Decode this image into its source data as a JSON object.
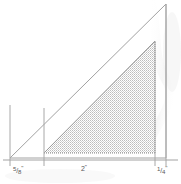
{
  "drawing": {
    "title": "Right triangle dimension drawing",
    "background_color": "#ffffff",
    "line_color": "#9a9a9a",
    "fill_color": "#c9c9c9",
    "text_color": "#585858",
    "outer_triangle": {
      "name": "outer-triangle",
      "vertices": [
        [
          10,
          158
        ],
        [
          166,
          158
        ],
        [
          166,
          4
        ]
      ],
      "filled": false
    },
    "shaded_triangle": {
      "name": "shaded-triangle",
      "vertices": [
        [
          44,
          153
        ],
        [
          155,
          153
        ],
        [
          155,
          41
        ]
      ],
      "filled": true,
      "fill_pattern": "stipple"
    },
    "dimension_line": {
      "name": "horizontal-dimension-line",
      "y": 160,
      "x_start": 3,
      "x_end": 178,
      "ticks": [
        10,
        44,
        155,
        166
      ]
    },
    "extension_lines": [
      {
        "name": "extension-line-left",
        "x": 10,
        "y_top": 105,
        "y_bottom": 166
      },
      {
        "name": "extension-line-inner",
        "x": 44,
        "y_top": 108,
        "y_bottom": 166
      },
      {
        "name": "extension-line-shade",
        "x": 155,
        "y_top": 41,
        "y_bottom": 166
      },
      {
        "name": "extension-line-right",
        "x": 166,
        "y_top": 4,
        "y_bottom": 166
      }
    ],
    "dimensions": [
      {
        "name": "dimension-left",
        "numerator": "5",
        "slash": "/",
        "denominator": "8",
        "unit": "\"",
        "text": "5/8\""
      },
      {
        "name": "dimension-middle",
        "value": "2",
        "unit": "\"",
        "text": "2\""
      },
      {
        "name": "dimension-right",
        "numerator": "1",
        "slash": "/",
        "denominator": "4",
        "unit": "\"",
        "text": "1/4\""
      }
    ]
  }
}
